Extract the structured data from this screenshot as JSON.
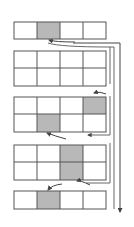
{
  "diagram": {
    "colors": {
      "stroke": "#555555",
      "shade": "#b8b8b8",
      "background": "#ffffff",
      "arrow": "#444444"
    },
    "columns": 4,
    "blocks": [
      {
        "id": "block-1",
        "rows": 1,
        "shaded": [
          [
            0,
            1
          ]
        ]
      },
      {
        "id": "block-2",
        "rows": 2,
        "shaded": []
      },
      {
        "id": "block-3",
        "rows": 2,
        "shaded": [
          [
            0,
            3
          ],
          [
            1,
            1
          ]
        ]
      },
      {
        "id": "block-4",
        "rows": 2,
        "shaded": [
          [
            0,
            2
          ],
          [
            1,
            2
          ]
        ]
      },
      {
        "id": "block-5",
        "rows": 1,
        "shaded": [
          [
            0,
            1
          ]
        ]
      }
    ],
    "main_arrow": {
      "direction": "down"
    }
  }
}
